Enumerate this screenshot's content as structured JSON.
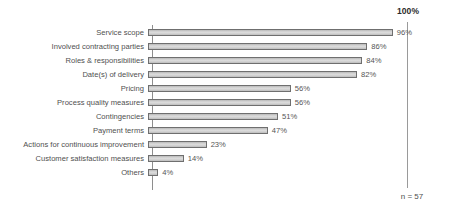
{
  "chart_data": {
    "type": "bar",
    "orientation": "horizontal",
    "title": "",
    "xlabel": "",
    "ylabel": "",
    "xlim": [
      0,
      100
    ],
    "grid": false,
    "legend": null,
    "categories": [
      "Service scope",
      "Involved contracting parties",
      "Roles & responsibilities",
      "Date(s) of delivery",
      "Pricing",
      "Process quality measures",
      "Contingencies",
      "Payment terms",
      "Actions for continuous improvement",
      "Customer satisfaction measures",
      "Others"
    ],
    "values": [
      96,
      86,
      84,
      82,
      56,
      56,
      51,
      47,
      23,
      14,
      4
    ],
    "value_labels": [
      "96%",
      "86%",
      "84%",
      "82%",
      "56%",
      "56%",
      "51%",
      "47%",
      "23%",
      "14%",
      "4%"
    ],
    "annotations": {
      "reference_line_label": "100%",
      "reference_line_value": 100,
      "sample_size": "n = 57"
    },
    "colors": {
      "bar_fill": "#d6d6d6",
      "bar_edge": "#6f6f6f",
      "axis": "#8e8e8e",
      "reference_line": "#9a9a9a",
      "text": "#4f4f4f",
      "background": "#ffffff"
    }
  }
}
